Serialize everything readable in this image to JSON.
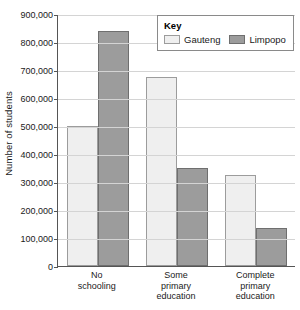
{
  "chart_data": {
    "type": "bar",
    "title": "",
    "xlabel": "",
    "ylabel": "Number of students",
    "categories": [
      "No\nschooling",
      "Some\nprimary\neducation",
      "Complete\nprimary\neducation"
    ],
    "series": [
      {
        "name": "Gauteng",
        "values": [
          500000,
          675000,
          325000
        ],
        "color": "#efefef"
      },
      {
        "name": "Limpopo",
        "values": [
          840000,
          350000,
          135000
        ],
        "color": "#9c9c9c"
      }
    ],
    "ylim": [
      0,
      900000
    ],
    "ytick_step": 100000,
    "ytick_labels": [
      "900,000",
      "800,000",
      "700,000",
      "600,000",
      "500,000",
      "400,000",
      "300,000",
      "200,000",
      "100,000",
      "0"
    ],
    "ytick_values": [
      900000,
      800000,
      700000,
      600000,
      500000,
      400000,
      300000,
      200000,
      100000,
      0
    ],
    "grid": true,
    "legend": {
      "title": "Key",
      "position": "top-right",
      "entries": [
        "Gauteng",
        "Limpopo"
      ]
    }
  },
  "legend": {
    "title": "Key",
    "items": [
      {
        "label": "Gauteng"
      },
      {
        "label": "Limpopo"
      }
    ]
  },
  "axes": {
    "y_title": "Number of students"
  }
}
